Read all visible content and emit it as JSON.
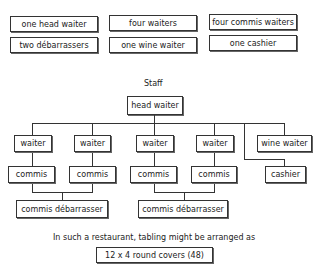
{
  "summary": {
    "row1": [
      "one head waiter",
      "four waiters",
      "four commis waiters"
    ],
    "row2": [
      "two débarrassers",
      "one wine waiter",
      "one cashier"
    ]
  },
  "chart": {
    "title": "Staff",
    "head": "head waiter",
    "waiters": [
      "waiter",
      "waiter",
      "waiter",
      "waiter"
    ],
    "wine_waiter": "wine waiter",
    "commis": [
      "commis",
      "commis",
      "commis",
      "commis"
    ],
    "cashier": "cashier",
    "debarrassers": [
      "commis débarrasser",
      "commis débarrasser"
    ]
  },
  "footer": {
    "sentence": "In such a restaurant, tabling might be arranged as",
    "tabling": "12 x 4 round covers (48)"
  }
}
